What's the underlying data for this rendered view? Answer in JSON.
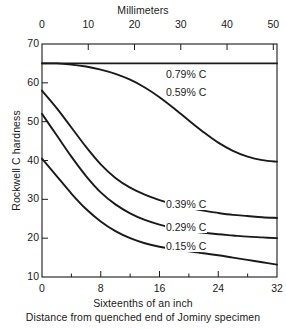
{
  "chart_data": {
    "type": "line",
    "title": "",
    "top_axis": {
      "label": "Millimeters",
      "ticks": [
        0,
        10,
        20,
        30,
        40,
        50
      ],
      "range": [
        0,
        50.8
      ]
    },
    "xlabel": "Sixteenths of an inch",
    "xsublabel": "Distance from quenched end of Jominy specimen",
    "xticks": [
      0,
      8,
      16,
      24,
      32
    ],
    "xminorticks": [
      4,
      12,
      20,
      28
    ],
    "xlim": [
      0,
      32
    ],
    "ylabel": "Rockwell C hardness",
    "yticks": [
      10,
      20,
      30,
      40,
      50,
      60,
      70
    ],
    "ylim": [
      10,
      70
    ],
    "grid": false,
    "legend_position": "inline-labels",
    "line_color": "#1a1a1a",
    "series": [
      {
        "name": "0.79% C",
        "label": "0.79% C",
        "x": [
          0,
          2,
          4,
          6,
          8,
          10,
          12,
          14,
          16,
          18,
          20,
          22,
          24,
          26,
          28,
          30,
          32
        ],
        "values": [
          65,
          65,
          65,
          65,
          65,
          65,
          65,
          65,
          65,
          65,
          65,
          65,
          65,
          65,
          65,
          65,
          65
        ]
      },
      {
        "name": "0.59% C",
        "label": "0.59% C",
        "x": [
          0,
          2,
          4,
          6,
          8,
          10,
          12,
          14,
          16,
          18,
          20,
          22,
          24,
          26,
          28,
          30,
          32
        ],
        "values": [
          65,
          65,
          64.7,
          64.2,
          63.4,
          62.3,
          60.8,
          58.8,
          56.3,
          53.4,
          50.3,
          47.3,
          44.6,
          42.5,
          41.0,
          40.1,
          39.7
        ]
      },
      {
        "name": "0.39% C",
        "label": "0.39% C",
        "x": [
          0,
          2,
          4,
          6,
          8,
          10,
          12,
          14,
          16,
          18,
          20,
          22,
          24,
          26,
          28,
          30,
          32
        ],
        "values": [
          58,
          53.5,
          48.5,
          43.5,
          39.0,
          35.5,
          33.0,
          31.2,
          29.8,
          28.7,
          27.8,
          27.1,
          26.5,
          26.0,
          25.7,
          25.4,
          25.2
        ]
      },
      {
        "name": "0.29% C",
        "label": "0.29% C",
        "x": [
          0,
          2,
          4,
          6,
          8,
          10,
          12,
          14,
          16,
          18,
          20,
          22,
          24,
          26,
          28,
          30,
          32
        ],
        "values": [
          52,
          46.5,
          41.0,
          36.0,
          31.8,
          28.7,
          26.4,
          24.7,
          23.5,
          22.6,
          21.9,
          21.4,
          21.0,
          20.7,
          20.4,
          20.2,
          20.0
        ]
      },
      {
        "name": "0.15% C",
        "label": "0.15% C",
        "x": [
          0,
          2,
          4,
          6,
          8,
          10,
          12,
          14,
          16,
          18,
          20,
          22,
          24,
          26,
          28,
          30,
          32
        ],
        "values": [
          40.5,
          36.0,
          31.5,
          27.5,
          24.3,
          21.8,
          20.0,
          18.7,
          17.8,
          17.2,
          16.6,
          16.1,
          15.6,
          15.0,
          14.4,
          13.8,
          13.2
        ]
      }
    ],
    "curve_labels": [
      {
        "text": "0.79% C",
        "x_px": 165,
        "y_px": 68
      },
      {
        "text": "0.59% C",
        "x_px": 165,
        "y_px": 86
      },
      {
        "text": "0.39% C",
        "x_px": 165,
        "y_px": 198
      },
      {
        "text": "0.29% C",
        "x_px": 165,
        "y_px": 221
      },
      {
        "text": "0.15% C",
        "x_px": 165,
        "y_px": 240
      }
    ]
  }
}
